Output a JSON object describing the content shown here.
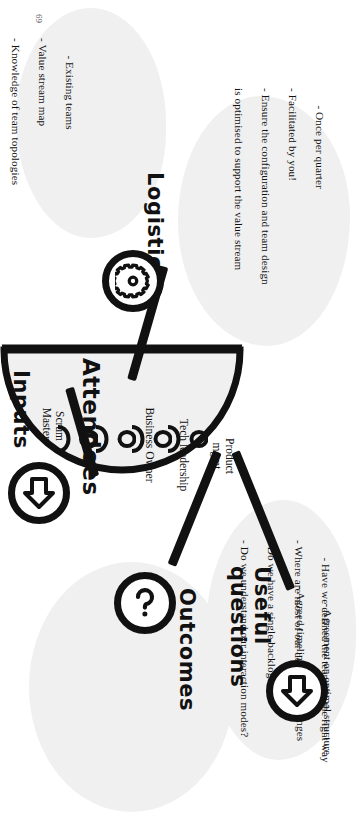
{
  "page": {
    "number": "69"
  },
  "diagram": {
    "center": {
      "title": "Attendees",
      "roles": [
        "Scrum\nMasters",
        "Business Owner",
        "Tech leadership",
        "Product\nmgmt"
      ]
    },
    "branches": [
      {
        "id": "inputs",
        "title": "Inputs",
        "icon": "arrow-up-circle-icon",
        "items": [
          "- Existing teams",
          "- Value stream map",
          "- Knowledge of team topologies",
          "framework"
        ]
      },
      {
        "id": "logistics",
        "title": "Logistics",
        "icon": "gear-circle-icon",
        "items": [
          "- Once per quarter",
          "- Facilitated by you!",
          "- Ensure the configuration and team design",
          "is optimised to support the value stream"
        ]
      },
      {
        "id": "useful-questions",
        "title": "Useful\nquestions",
        "icon": "question-mark-circle-icon",
        "items": [
          "- Have we defined the teams in the right way",
          "- Where are most of our dependencies?",
          "- Do we have a single backlog?",
          "- Do we understand our interaction modes?"
        ]
      },
      {
        "id": "outcomes",
        "title": "Outcomes",
        "icon": "arrow-up-circle-icon",
        "items": [
          "- Agreement on optimal structure",
          "- Agreed timeline for any changes"
        ]
      }
    ]
  },
  "colors": {
    "ink": "#111111",
    "blob": "#f0f0f0",
    "paper": "#ffffff"
  }
}
